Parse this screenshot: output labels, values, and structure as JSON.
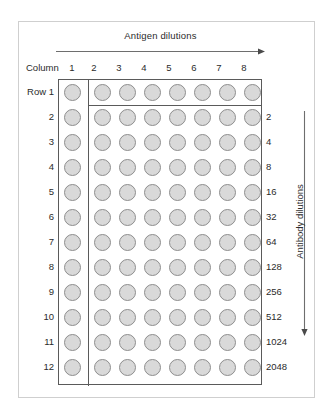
{
  "figure": {
    "type": "microtiter-plate-diagram"
  },
  "axes": {
    "antigen": {
      "label": "Antigen dilutions",
      "direction": "right",
      "arrow_icon": "arrow-right-icon"
    },
    "antibody": {
      "label": "Antibody dilutions",
      "direction": "down",
      "arrow_icon": "arrow-down-icon"
    }
  },
  "columns": {
    "header_label": "Column",
    "numbers": [
      "1",
      "2",
      "3",
      "4",
      "5",
      "6",
      "7",
      "8"
    ]
  },
  "rows": {
    "header_label": "Row 1",
    "numbers": [
      "2",
      "3",
      "4",
      "5",
      "6",
      "7",
      "8",
      "9",
      "10",
      "11",
      "12"
    ]
  },
  "antibody_dilution_values": [
    "2",
    "4",
    "8",
    "16",
    "32",
    "64",
    "128",
    "256",
    "512",
    "1024",
    "2048"
  ],
  "plate": {
    "row_count": 12,
    "column_count": 8,
    "well_count": 96,
    "well_fill_color": "#d9d9d9",
    "well_border_color": "#8e8e8e",
    "plate_border_color": "#5a5a5a",
    "divider_after_column": 1,
    "divider_after_row": 1
  },
  "colors": {
    "background": "#ffffff",
    "frame": "#cfcfcf",
    "text": "#2b2b2b",
    "arrow": "#6e6e6e"
  }
}
